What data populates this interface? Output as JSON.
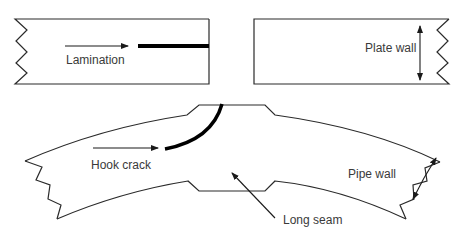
{
  "diagram": {
    "type": "defect-schematic",
    "panels": [
      {
        "id": "plate-lamination",
        "feature": "Lamination"
      },
      {
        "id": "plate-wall",
        "feature": "Plate wall"
      },
      {
        "id": "pipe-section",
        "features": [
          "Hook crack",
          "Long seam",
          "Pipe wall"
        ]
      }
    ]
  },
  "labels": {
    "lamination": "Lamination",
    "plate_wall": "Plate wall",
    "hook_crack": "Hook crack",
    "long_seam": "Long seam",
    "pipe_wall": "Pipe wall"
  },
  "colors": {
    "line": "#2a2a2a",
    "defect": "#000000",
    "text": "#3a3a3a",
    "background": "#ffffff"
  }
}
